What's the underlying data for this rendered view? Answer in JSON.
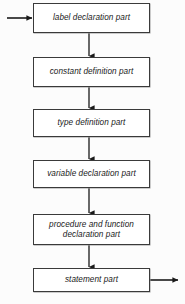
{
  "diagram": {
    "orientation": "vertical",
    "background_color": "#fcfcfc",
    "box_fill_color": "#ffffff",
    "box_border_color": "#3a3a3a",
    "arrow_color": "#1a1a1a",
    "entry_arrow": {
      "name": "entry-arrow",
      "direction": "right",
      "from_x": 7,
      "to_x": 33,
      "y": 18
    },
    "exit_arrow": {
      "name": "exit-arrow",
      "direction": "right",
      "from_x": 150,
      "to_x": 179,
      "y": 280
    },
    "nodes": [
      {
        "id": "label-declaration-part",
        "label": "label declaration part",
        "x": 33,
        "y": 3,
        "width": 117,
        "height": 30
      },
      {
        "id": "constant-definition-part",
        "label": "constant definition part",
        "x": 33,
        "y": 57,
        "width": 117,
        "height": 30
      },
      {
        "id": "type-definition-part",
        "label": "type definition part",
        "x": 33,
        "y": 109,
        "width": 117,
        "height": 28
      },
      {
        "id": "variable-declaration-part",
        "label": "variable declaration part",
        "x": 33,
        "y": 160,
        "width": 117,
        "height": 28
      },
      {
        "id": "procedure-and-function-declaration-part",
        "label": "procedure and function\ndeclaration part",
        "x": 33,
        "y": 214,
        "width": 117,
        "height": 31
      },
      {
        "id": "statement-part",
        "label": "statement part",
        "x": 33,
        "y": 268,
        "width": 117,
        "height": 24
      }
    ],
    "connectors": [
      {
        "id": "c1",
        "from": "label-declaration-part",
        "to": "constant-definition-part",
        "x": 89,
        "y1": 33,
        "y2": 57
      },
      {
        "id": "c2",
        "from": "constant-definition-part",
        "to": "type-definition-part",
        "x": 89,
        "y1": 87,
        "y2": 109
      },
      {
        "id": "c3",
        "from": "type-definition-part",
        "to": "variable-declaration-part",
        "x": 89,
        "y1": 137,
        "y2": 160
      },
      {
        "id": "c4",
        "from": "variable-declaration-part",
        "to": "procedure-and-function-declaration-part",
        "x": 89,
        "y1": 188,
        "y2": 214
      },
      {
        "id": "c5",
        "from": "procedure-and-function-declaration-part",
        "to": "statement-part",
        "x": 89,
        "y1": 245,
        "y2": 268
      }
    ]
  }
}
